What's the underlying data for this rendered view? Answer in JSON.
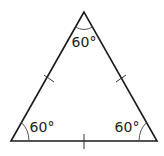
{
  "diagram": {
    "type": "equilateral-triangle",
    "colors": {
      "stroke": "#1a1a1a",
      "tick": "#333333",
      "arc": "#555555",
      "text": "#222222",
      "background": "#ffffff"
    },
    "vertices": {
      "top": {
        "x": 84,
        "y": 12
      },
      "bottom_left": {
        "x": 11,
        "y": 141
      },
      "bottom_right": {
        "x": 157,
        "y": 141
      }
    },
    "angles": {
      "top": {
        "label": "60°"
      },
      "bottom_left": {
        "label": "60°"
      },
      "bottom_right": {
        "label": "60°"
      }
    },
    "equal_side_marks": {
      "left": "single tick",
      "right": "single tick",
      "bottom": "single tick"
    }
  }
}
